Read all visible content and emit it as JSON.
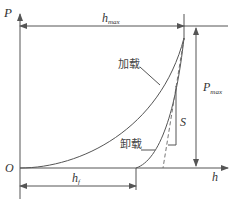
{
  "diagram": {
    "type": "load-displacement curve (nanoindentation)",
    "axes": {
      "y_label": "P",
      "x_label": "h",
      "origin_label": "O"
    },
    "annotations": {
      "h_max": {
        "main": "h",
        "sub": "max"
      },
      "P_max": {
        "main": "P",
        "sub": "max"
      },
      "h_f": {
        "main": "h",
        "sub": "f"
      },
      "stiffness": "S"
    },
    "curves": {
      "loading_label": "加载",
      "unloading_label": "卸载"
    },
    "colors": {
      "line": "#555555",
      "text": "#333333",
      "background": "#ffffff"
    }
  }
}
